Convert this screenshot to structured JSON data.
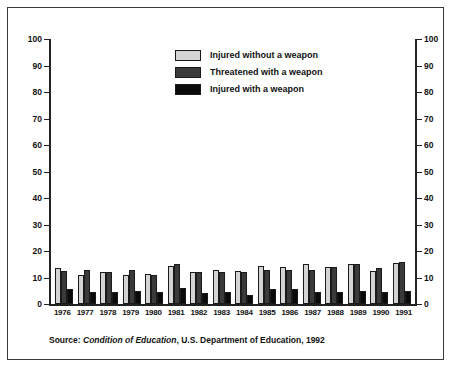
{
  "chart_data": {
    "type": "bar",
    "title": "",
    "xlabel": "",
    "ylabel": "",
    "ylim": [
      0,
      100
    ],
    "ytick_values": [
      0,
      10,
      20,
      30,
      40,
      50,
      60,
      70,
      80,
      90,
      100
    ],
    "ytick_labels": [
      "0",
      "10",
      "20",
      "30",
      "40",
      "50",
      "60",
      "70",
      "80",
      "90",
      "100"
    ],
    "grid": false,
    "legend_position": "top-center",
    "dual_y_axis": true,
    "categories": [
      "1976",
      "1977",
      "1978",
      "1979",
      "1980",
      "1981",
      "1982",
      "1983",
      "1984",
      "1985",
      "1986",
      "1987",
      "1988",
      "1989",
      "1990",
      "1991"
    ],
    "series": [
      {
        "name": "Injured without a weapon",
        "color": "#d4d4d4",
        "values": [
          13.5,
          11.0,
          12.0,
          11.0,
          11.5,
          14.5,
          12.0,
          13.0,
          12.5,
          14.5,
          14.0,
          15.0,
          14.0,
          15.0,
          12.5,
          15.5
        ]
      },
      {
        "name": "Threatened with a weapon",
        "color": "#3a3a3a",
        "values": [
          12.5,
          13.0,
          12.0,
          13.0,
          11.0,
          15.0,
          12.0,
          12.0,
          12.0,
          13.0,
          13.0,
          13.0,
          14.0,
          15.0,
          13.5,
          16.0
        ]
      },
      {
        "name": "Injured with a weapon",
        "color": "#0a0a0a",
        "values": [
          5.5,
          4.5,
          4.5,
          5.0,
          4.5,
          6.0,
          4.0,
          4.5,
          3.5,
          5.5,
          5.5,
          4.5,
          4.5,
          5.0,
          4.5,
          5.0
        ]
      }
    ]
  },
  "legend": {
    "items": [
      {
        "label": "Injured without a weapon",
        "swatch": "s0"
      },
      {
        "label": "Threatened with a weapon",
        "swatch": "s1"
      },
      {
        "label": "Injured with a weapon",
        "swatch": "s2"
      }
    ]
  },
  "source": {
    "prefix": "Source: ",
    "italic": "Condition of Education",
    "suffix": ", U.S. Department of Education, 1992"
  }
}
